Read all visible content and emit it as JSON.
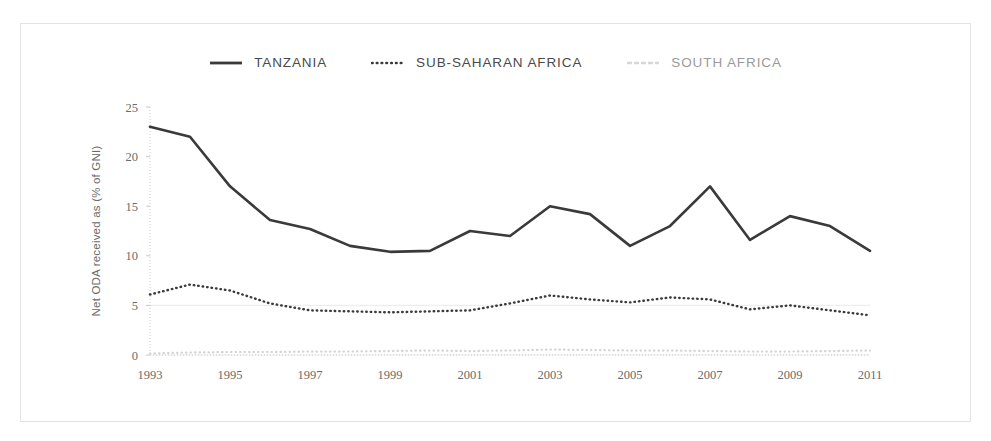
{
  "chart_data": {
    "type": "line",
    "title": "",
    "xlabel": "",
    "ylabel": "Net ODA received as (% of GNI)",
    "x": [
      1993,
      1994,
      1995,
      1996,
      1997,
      1998,
      1999,
      2000,
      2001,
      2002,
      2003,
      2004,
      2005,
      2006,
      2007,
      2008,
      2009,
      2010,
      2011
    ],
    "xtick_labels": [
      "1993",
      "1995",
      "1997",
      "1999",
      "2001",
      "2003",
      "2005",
      "2007",
      "2009",
      "2011"
    ],
    "xticks": [
      1993,
      1995,
      1997,
      1999,
      2001,
      2003,
      2005,
      2007,
      2009,
      2011
    ],
    "xlim": [
      1993,
      2011
    ],
    "ylim": [
      0,
      25
    ],
    "yticks": [
      0,
      5,
      10,
      15,
      20,
      25
    ],
    "ytick_labels": [
      "0",
      "5",
      "10",
      "15",
      "20",
      "25"
    ],
    "grid": true,
    "legend_position": "top-center",
    "series": [
      {
        "name": "TANZANIA",
        "style": "solid",
        "color": "#3a3a3a",
        "width": 2.6,
        "values": [
          23.0,
          22.0,
          17.0,
          13.6,
          12.7,
          11.0,
          10.4,
          10.5,
          12.5,
          12.0,
          15.0,
          14.2,
          11.0,
          13.0,
          17.0,
          11.6,
          14.0,
          13.0,
          10.5
        ]
      },
      {
        "name": "SUB-SAHARAN AFRICA",
        "style": "dotted",
        "color": "#3a3a3a",
        "width": 2.4,
        "values": [
          6.1,
          7.1,
          6.5,
          5.2,
          4.5,
          4.4,
          4.3,
          4.4,
          4.5,
          5.2,
          6.0,
          5.6,
          5.3,
          5.8,
          5.6,
          4.6,
          5.0,
          4.5,
          4.0
        ]
      },
      {
        "name": "SOUTH AFRICA",
        "style": "dotted",
        "color": "#d4d4d4",
        "width": 2.2,
        "values": [
          0.15,
          0.25,
          0.3,
          0.3,
          0.35,
          0.35,
          0.4,
          0.45,
          0.4,
          0.45,
          0.55,
          0.5,
          0.45,
          0.45,
          0.4,
          0.35,
          0.35,
          0.4,
          0.45
        ]
      }
    ]
  },
  "legend": {
    "items": [
      {
        "label": "TANZANIA",
        "style": "solid",
        "color": "#3a3a3a"
      },
      {
        "label": "SUB-SAHARAN AFRICA",
        "style": "dotted",
        "color": "#3a3a3a"
      },
      {
        "label": "SOUTH AFRICA",
        "style": "dashed",
        "color": "#d7d7d7"
      }
    ]
  },
  "colors": {
    "frame_border": "#e3e3e3",
    "grid": "#ededed",
    "axis_text": "#6b6b6b",
    "background": "#ffffff"
  }
}
